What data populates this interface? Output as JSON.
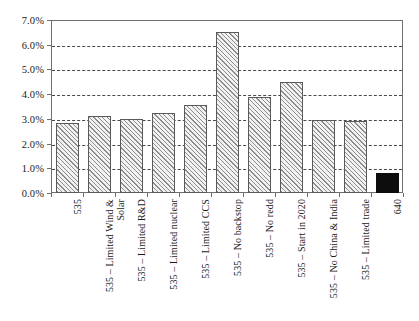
{
  "chart_data": {
    "type": "bar",
    "title": "",
    "subtitle": "",
    "xlabel": "",
    "ylabel": "",
    "ylim": [
      0.0,
      7.0
    ],
    "y_tick_labels": [
      "0.0%",
      "1.0%",
      "2.0%",
      "3.0%",
      "4.0%",
      "5.0%",
      "6.0%",
      "7.0%"
    ],
    "y_tick_values": [
      0.0,
      1.0,
      2.0,
      3.0,
      4.0,
      5.0,
      6.0,
      7.0
    ],
    "y_unit": "%",
    "grid": "horizontal-dashed",
    "legend": "none",
    "categories": [
      "535",
      "535 – Limited Wind &\nSolar",
      "535 – Limited R&D",
      "535 – Limited nuclear",
      "535 – Limited CCS",
      "535 – No backstop",
      "535 – No redd",
      "535 – Start in 2020",
      "535 – No China & India",
      "535 – Limited trade",
      "640"
    ],
    "values": [
      2.85,
      3.12,
      3.0,
      3.25,
      3.55,
      6.5,
      3.9,
      4.5,
      2.97,
      2.92,
      0.8
    ],
    "bar_styles": [
      "hatched",
      "hatched",
      "hatched",
      "hatched",
      "hatched",
      "hatched",
      "hatched",
      "hatched",
      "hatched",
      "hatched",
      "solid"
    ],
    "colors": {
      "hatch_line": "#8d8d8d",
      "bar_fill": "#f2f2f2",
      "bar_border": "#5a5a5a",
      "solid_bar": "#0d0d0d",
      "gridline": "#4a4a4a",
      "axis": "#6f6f6f",
      "text": "#1a1a1a",
      "background": "#ffffff"
    }
  }
}
